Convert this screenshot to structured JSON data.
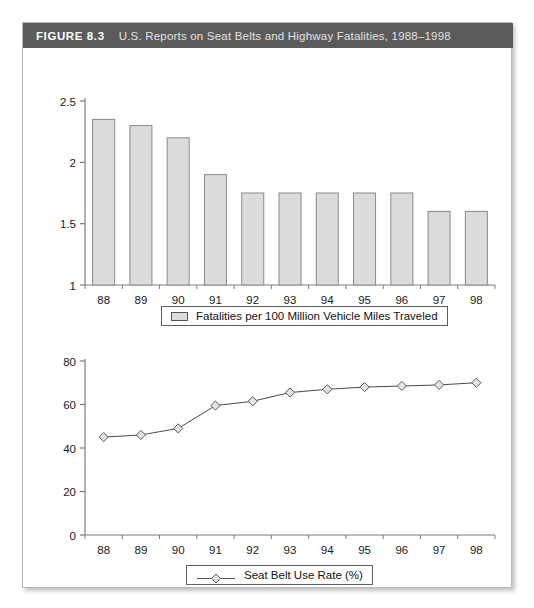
{
  "figure": {
    "label": "FIGURE 8.3",
    "title": "U.S. Reports on Seat Belts and Highway Fatalities, 1988–1998",
    "header_bg": "#5b5b5b",
    "frame_border": "#b9b9b9"
  },
  "legends": {
    "bars": {
      "text": "Fatalities per 100 Million Vehicle Miles Traveled",
      "swatch_fill": "#dcdcdc",
      "swatch_stroke": "#555555"
    },
    "line": {
      "text": "Seat Belt Use Rate (%)",
      "marker": "diamond",
      "marker_fill": "#e3e3e3",
      "line_color": "#4a4a4a"
    }
  },
  "chart_data": [
    {
      "type": "bar",
      "title": "Fatalities per 100 Million Vehicle Miles Traveled",
      "xlabel": "",
      "ylabel": "",
      "categories": [
        "88",
        "89",
        "90",
        "91",
        "92",
        "93",
        "94",
        "95",
        "96",
        "97",
        "98"
      ],
      "values": [
        2.35,
        2.3,
        2.2,
        1.9,
        1.75,
        1.75,
        1.75,
        1.75,
        1.75,
        1.6,
        1.6
      ],
      "ylim": [
        1,
        2.5
      ],
      "yticks": [
        1,
        1.5,
        2,
        2.5
      ],
      "ytick_labels": [
        "1",
        "1.5",
        "2",
        "2.5"
      ],
      "grid": false,
      "legend_position": "bottom",
      "bar_fill": "#dcdcdc",
      "bar_stroke": "#8a8a8a"
    },
    {
      "type": "line",
      "title": "Seat Belt Use Rate (%)",
      "xlabel": "",
      "ylabel": "",
      "categories": [
        "88",
        "89",
        "90",
        "91",
        "92",
        "93",
        "94",
        "95",
        "96",
        "97",
        "98"
      ],
      "values": [
        45,
        46,
        49,
        59.5,
        61.5,
        65.5,
        67,
        68,
        68.5,
        69,
        70
      ],
      "ylim": [
        0,
        80
      ],
      "yticks": [
        0,
        20,
        40,
        60,
        80
      ],
      "ytick_labels": [
        "0",
        "20",
        "40",
        "60",
        "80"
      ],
      "grid": false,
      "legend_position": "bottom",
      "marker": "diamond",
      "marker_fill": "#e3e3e3",
      "line_color": "#4a4a4a"
    }
  ]
}
